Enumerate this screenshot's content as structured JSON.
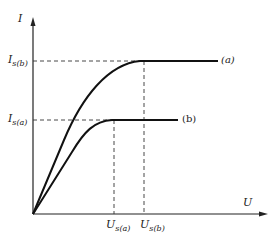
{
  "diagram": {
    "type": "I-U saturation characteristic curves",
    "axes": {
      "y_label": "I",
      "x_label": "U"
    },
    "y_ticks": [
      {
        "main": "I",
        "sub": "s(b)"
      },
      {
        "main": "I",
        "sub": "s(a)"
      }
    ],
    "x_ticks": [
      {
        "main": "U",
        "sub": "s(a)"
      },
      {
        "main": "U",
        "sub": "s(b)"
      }
    ],
    "curves": [
      {
        "label": "(a)",
        "description": "upper curve, saturates at higher current"
      },
      {
        "label": "(b)",
        "description": "lower curve, saturates at lower current"
      }
    ],
    "colors": {
      "line": "#111111",
      "background": "#ffffff"
    }
  }
}
